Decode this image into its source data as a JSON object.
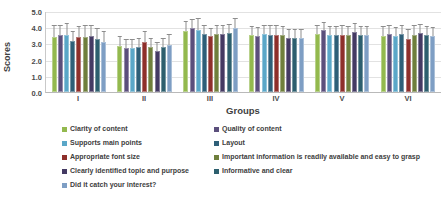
{
  "chart_data": {
    "type": "bar",
    "title": "",
    "xlabel": "Groups",
    "ylabel": "Scores",
    "ylim": [
      0.0,
      5.0
    ],
    "yticks": [
      "5.0",
      "4.0",
      "3.0",
      "2.0",
      "1.0",
      "0.0"
    ],
    "grid": true,
    "legend_position": "bottom",
    "error_bars": true,
    "categories": [
      "I",
      "II",
      "III",
      "IV",
      "V",
      "VI"
    ],
    "series": [
      {
        "name": "Clarity of content",
        "color": "#93b94e",
        "values": [
          3.4,
          2.85,
          3.75,
          3.5,
          3.6,
          3.45
        ],
        "errors": [
          0.65,
          0.55,
          0.6,
          0.5,
          0.5,
          0.55
        ]
      },
      {
        "name": "Quality of content",
        "color": "#5b4f7c",
        "values": [
          3.5,
          2.7,
          3.95,
          3.45,
          3.8,
          3.6
        ],
        "errors": [
          0.6,
          0.5,
          0.5,
          0.5,
          0.45,
          0.5
        ]
      },
      {
        "name": "Supports main points",
        "color": "#5aa7c8",
        "values": [
          3.5,
          2.7,
          3.85,
          3.6,
          3.5,
          3.45
        ],
        "errors": [
          0.7,
          0.5,
          0.65,
          0.5,
          0.5,
          0.5
        ]
      },
      {
        "name": "Layout",
        "color": "#2e5f78",
        "values": [
          3.15,
          2.75,
          3.6,
          3.55,
          3.5,
          3.6
        ],
        "errors": [
          0.55,
          0.5,
          0.5,
          0.5,
          0.5,
          0.5
        ]
      },
      {
        "name": "Appropriate font size",
        "color": "#8e2f2b",
        "values": [
          3.4,
          3.1,
          3.45,
          3.55,
          3.5,
          3.3
        ],
        "errors": [
          0.6,
          0.6,
          0.45,
          0.5,
          0.55,
          0.5
        ]
      },
      {
        "name": "Important information is readily available and easy to grasp",
        "color": "#6f7f3c",
        "values": [
          3.4,
          2.75,
          3.6,
          3.5,
          3.5,
          3.55
        ],
        "errors": [
          0.65,
          0.5,
          0.5,
          0.5,
          0.5,
          0.5
        ]
      },
      {
        "name": "Clearly identified topic and purpose",
        "color": "#443a63",
        "values": [
          3.45,
          2.55,
          3.6,
          3.35,
          3.7,
          3.65
        ],
        "errors": [
          0.6,
          0.45,
          0.5,
          0.5,
          0.5,
          0.5
        ]
      },
      {
        "name": "Informative and clear",
        "color": "#2d5f6e",
        "values": [
          3.3,
          2.75,
          3.65,
          3.35,
          3.5,
          3.5
        ],
        "errors": [
          0.6,
          0.5,
          0.5,
          0.5,
          0.5,
          0.5
        ]
      },
      {
        "name": "Did it catch your interest?",
        "color": "#7e9ec4",
        "values": [
          3.1,
          2.9,
          3.95,
          3.35,
          3.5,
          3.45
        ],
        "errors": [
          0.6,
          0.6,
          0.55,
          0.5,
          0.5,
          0.5
        ]
      }
    ],
    "legend_columns": {
      "left": [
        0,
        2,
        4,
        6,
        8
      ],
      "right": [
        1,
        3,
        5,
        7
      ]
    }
  }
}
